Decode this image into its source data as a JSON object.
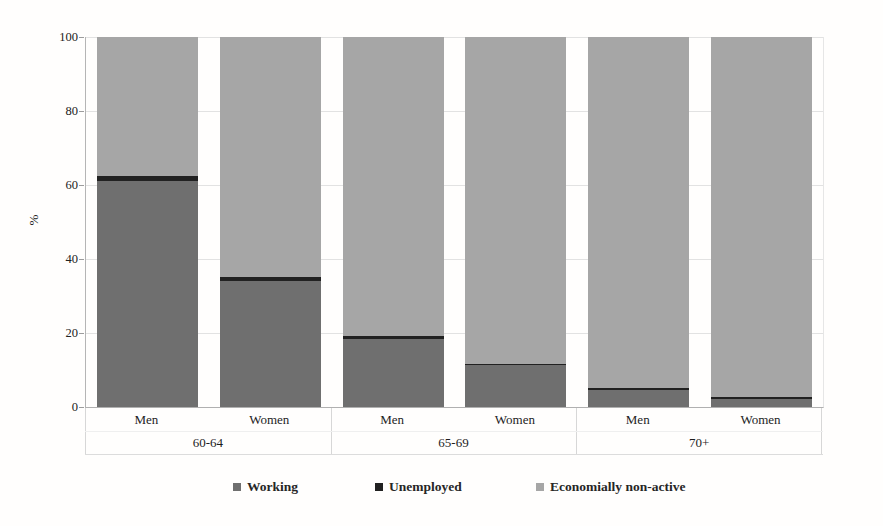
{
  "figure": {
    "title": "",
    "y_axis_title": "%"
  },
  "chart_data": {
    "type": "bar",
    "stacked": true,
    "title": "",
    "xlabel": "",
    "ylabel": "%",
    "ylim": [
      0,
      100
    ],
    "y_ticks": [
      0,
      20,
      40,
      60,
      80,
      100
    ],
    "grid": "horizontal light gray lines every 20",
    "legend_position": "bottom",
    "groups": [
      "60-64",
      "65-69",
      "70+"
    ],
    "categories_per_group": [
      "Men",
      "Women"
    ],
    "bar_order": [
      "Men 60-64",
      "Women 60-64",
      "Men 65-69",
      "Women 65-69",
      "Men 70+",
      "Women 70+"
    ],
    "stack_order_bottom_to_top": [
      "Working",
      "Unemployed",
      "Economially non-active"
    ],
    "series": [
      {
        "name": "Working",
        "color": "#6f6f6f",
        "values": [
          61,
          34,
          18.3,
          11.4,
          4.6,
          2.2
        ]
      },
      {
        "name": "Unemployed",
        "color": "#212121",
        "values": [
          1.5,
          1.2,
          1.0,
          0.3,
          0.5,
          0.4
        ]
      },
      {
        "name": "Economially non-active",
        "color": "#a6a6a6",
        "values": [
          37.5,
          64.8,
          80.7,
          88.3,
          94.9,
          97.4
        ]
      }
    ],
    "bars": [
      {
        "group": "60-64",
        "gender": "Men",
        "working": 61,
        "unemployed": 1.5,
        "non_active": 37.5
      },
      {
        "group": "60-64",
        "gender": "Women",
        "working": 34,
        "unemployed": 1.2,
        "non_active": 64.8
      },
      {
        "group": "65-69",
        "gender": "Men",
        "working": 18.3,
        "unemployed": 1.0,
        "non_active": 80.7
      },
      {
        "group": "65-69",
        "gender": "Women",
        "working": 11.4,
        "unemployed": 0.3,
        "non_active": 88.3
      },
      {
        "group": "70+",
        "gender": "Men",
        "working": 4.6,
        "unemployed": 0.5,
        "non_active": 94.9
      },
      {
        "group": "70+",
        "gender": "Women",
        "working": 2.2,
        "unemployed": 0.4,
        "non_active": 97.4
      }
    ],
    "legend": [
      "Working",
      "Unemployed",
      "Economially non-active"
    ]
  }
}
